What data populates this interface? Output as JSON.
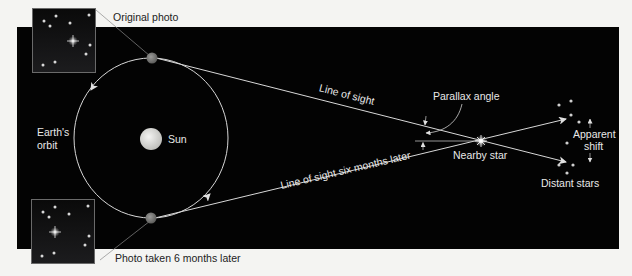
{
  "diagram": {
    "labels": {
      "original_photo": "Original photo",
      "photo_later": "Photo taken 6 months later",
      "earths_orbit_line1": "Earth's",
      "earths_orbit_line2": "orbit",
      "sun": "Sun",
      "line_of_sight": "Line of sight",
      "line_of_sight_later": "Line of sight six months later",
      "parallax_angle": "Parallax angle",
      "nearby_star": "Nearby star",
      "apparent_shift_line1": "Apparent",
      "apparent_shift_line2": "shift",
      "distant_stars": "Distant stars"
    },
    "colors": {
      "background": "#f4f4f2",
      "panel": "#030303",
      "line": "#d8d8d8",
      "earth": "#7a7a78",
      "sun": "#e0e0de",
      "text_light": "#e8e8e8",
      "text_dark": "#222222"
    }
  }
}
